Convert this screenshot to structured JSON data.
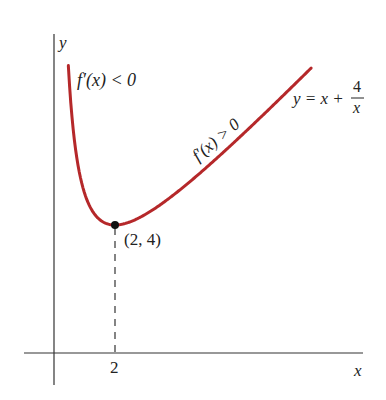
{
  "diagram": {
    "function": "y = x + 4/x",
    "axes": {
      "x_label": "x",
      "y_label": "y",
      "x_ticks": [
        {
          "value": 2,
          "label": "2"
        }
      ]
    },
    "point": {
      "x": 2,
      "y": 4,
      "label": "(2, 4)"
    },
    "annotations": {
      "decreasing": "f′(x) < 0",
      "increasing": "f′(x) > 0",
      "equation_lhs": "y = x +",
      "equation_num": "4",
      "equation_den": "x"
    },
    "colors": {
      "curve": "#b5282a",
      "axes": "#333333",
      "text": "#222222"
    },
    "x_range": [
      0.47,
      8.43
    ]
  }
}
